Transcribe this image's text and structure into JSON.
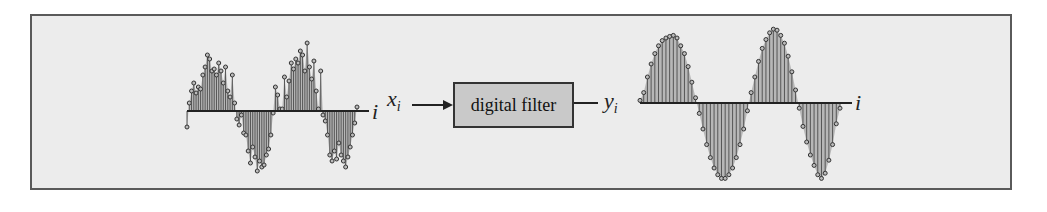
{
  "diagram": {
    "title": "",
    "filter_box": {
      "label": "digital filter"
    },
    "input_signal": {
      "label": "x",
      "subscript": "i",
      "axis_label": "i",
      "description": "noisy sampled sinusoid (stem plot)"
    },
    "output_signal": {
      "label": "y",
      "subscript": "i",
      "axis_label": "i",
      "description": "smoothed sampled sinusoid (stem plot)"
    },
    "colors": {
      "frame_bg": "#ececec",
      "frame_border": "#5a5a5a",
      "box_fill": "#c9c9c9",
      "stem": "#555555",
      "fill": "#8c8c8c"
    }
  },
  "chart_data": [
    {
      "type": "stem",
      "title": "",
      "xlabel": "i",
      "ylabel": "x_i",
      "grid": false,
      "note": "Estimated values; the plot has no axis ticks or numeric labels.",
      "values": [
        -0.4,
        0.2,
        0.5,
        0.7,
        0.45,
        0.6,
        0.55,
        0.9,
        1.1,
        1.4,
        1.3,
        1.0,
        1.05,
        0.9,
        1.2,
        1.0,
        0.7,
        1.1,
        0.5,
        0.35,
        0.9,
        0.2,
        -0.2,
        -0.35,
        -0.1,
        -0.55,
        -0.6,
        -1.0,
        -1.3,
        -0.9,
        -1.15,
        -1.5,
        -1.25,
        -1.4,
        -1.35,
        -1.1,
        -0.95,
        -0.6,
        -0.05,
        0.6,
        0.4,
        0.05,
        0.05,
        0.85,
        0.35,
        0.75,
        1.2,
        1.05,
        1.3,
        1.2,
        1.5,
        1.4,
        1.0,
        1.7,
        1.1,
        0.8,
        1.25,
        0.5,
        0.05,
        1.0,
        -0.1,
        -0.25,
        -0.6,
        -1.1,
        -1.25,
        -1.0,
        -1.2,
        -0.8,
        -1.1,
        -1.25,
        -1.4,
        -1.15,
        -0.9,
        -0.6,
        -0.3,
        0.1
      ]
    },
    {
      "type": "stem",
      "title": "",
      "xlabel": "i",
      "ylabel": "y_i",
      "grid": false,
      "note": "Estimated values; the plot has no axis ticks or numeric labels.",
      "values": [
        0.05,
        0.2,
        0.5,
        0.75,
        0.95,
        1.1,
        1.2,
        1.25,
        1.28,
        1.3,
        1.25,
        1.1,
        0.95,
        0.7,
        0.4,
        0.1,
        -0.2,
        -0.5,
        -0.8,
        -1.05,
        -1.25,
        -1.38,
        -1.45,
        -1.45,
        -1.38,
        -1.25,
        -1.05,
        -0.8,
        -0.5,
        -0.15,
        0.2,
        0.5,
        0.8,
        1.05,
        1.22,
        1.35,
        1.42,
        1.4,
        1.3,
        1.15,
        0.9,
        0.6,
        0.25,
        -0.1,
        -0.45,
        -0.75,
        -1.0,
        -1.2,
        -1.38,
        -1.45,
        -1.35,
        -1.1,
        -0.8,
        -0.4,
        -0.1
      ]
    }
  ]
}
